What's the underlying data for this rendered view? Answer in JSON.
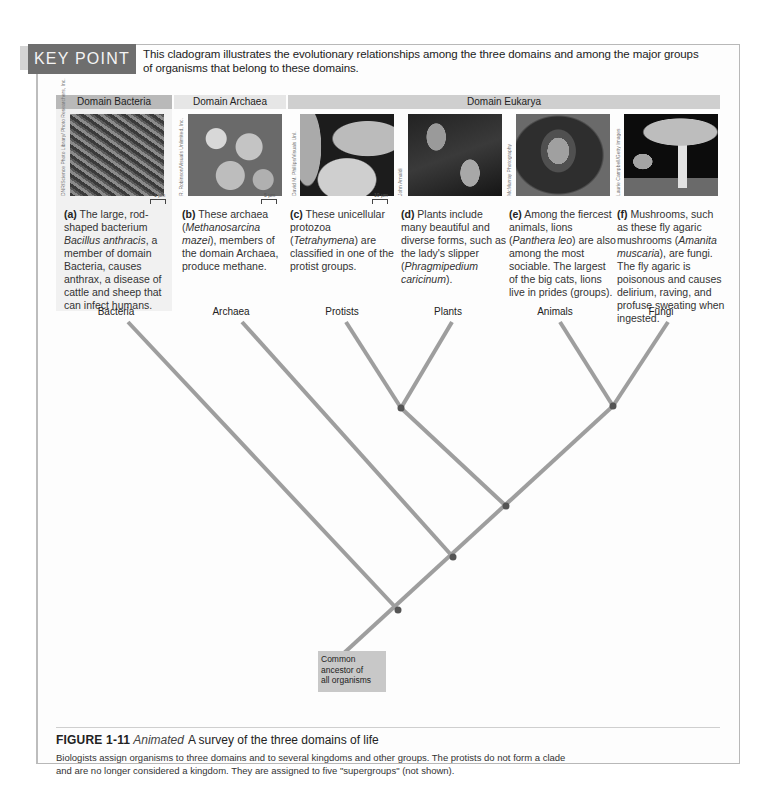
{
  "key_point": {
    "label": "KEY POINT",
    "text": "This cladogram illustrates the evolutionary relationships among the three domains and among the major groups of organisms that belong to these domains."
  },
  "domains": {
    "bacteria": "Domain Bacteria",
    "archaea": "Domain Archaea",
    "eukarya": "Domain Eukarya"
  },
  "panels": [
    {
      "id": "a",
      "letter": "(a)",
      "text_parts": [
        "The large, rod-shaped bacterium ",
        "Bacillus anthracis",
        ", a member of domain Bacteria, causes anthrax, a disease of cattle and sheep that can infect humans."
      ],
      "credit": "DNR/Science Photo Library/ Photo Researchers, Inc.",
      "scale": "1 µm",
      "group": "Bacteria"
    },
    {
      "id": "b",
      "letter": "(b)",
      "text_parts": [
        "These archaea (",
        "Methanosarcina mazei",
        "), members of the domain Archaea, produce methane."
      ],
      "credit": "R. Robinson/Visuals Unlimited, Inc.",
      "scale": "5 µm",
      "group": "Archaea"
    },
    {
      "id": "c",
      "letter": "(c)",
      "text_parts": [
        "These unicellular protozoa (",
        "Tetrahymena",
        ") are classified in one of the protist groups."
      ],
      "credit": "David M. Phillips/Visuals Unl.",
      "scale": "10 µm",
      "group": "Protists"
    },
    {
      "id": "d",
      "letter": "(d)",
      "text_parts": [
        "Plants include many beautiful and diverse forms, such as the lady's slipper (",
        "Phragmipedium caricinum",
        ")."
      ],
      "credit": "John Arnaldi",
      "scale": "",
      "group": "Plants"
    },
    {
      "id": "e",
      "letter": "(e)",
      "text_parts": [
        "Among the fiercest animals, lions (",
        "Panthera leo",
        ") are also among the most sociable. The largest of the big cats, lions live in prides (groups)."
      ],
      "credit": "McMurray Photography",
      "scale": "",
      "group": "Animals"
    },
    {
      "id": "f",
      "letter": "(f)",
      "text_parts": [
        "Mushrooms, such as these fly agaric mushrooms (",
        "Amanita muscaria",
        "), are fungi. The fly agaric is poisonous and causes delirium, raving, and profuse sweating when ingested."
      ],
      "credit": "Laurie Campbell/Getty Images",
      "scale": "",
      "group": "Fungi"
    }
  ],
  "tree": {
    "root_label": "Common ancestor of all organisms",
    "root_lines": [
      "Common",
      "ancestor of",
      "all organisms"
    ],
    "branch_color": "#9a9a9a",
    "node_color": "#555555"
  },
  "figure": {
    "number": "FIGURE 1-11",
    "tag": "Animated",
    "title": "A survey of the three domains of life",
    "description": "Biologists assign organisms to three domains and to several kingdoms and other groups. The protists do not form a clade and are no longer considered a kingdom. They are assigned to five \"supergroups\" (not shown)."
  }
}
